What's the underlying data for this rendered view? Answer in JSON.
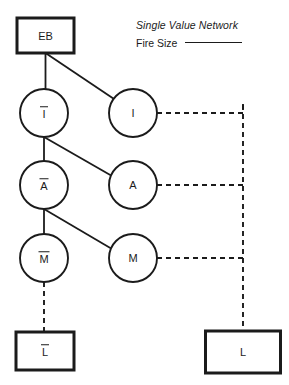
{
  "legend": {
    "title": "Single Value Network",
    "field_label": "Fire Size",
    "field_value": ""
  },
  "diagram": {
    "type": "influence-network",
    "stroke_color": "#1b1b1b",
    "background": "#ffffff",
    "nodes": [
      {
        "id": "EB",
        "label": "EB",
        "overbar": false,
        "shape": "rect",
        "column": "left",
        "cx": 45.5,
        "cy": 35.5,
        "w": 57,
        "h": 35
      },
      {
        "id": "I_bar",
        "label": "I",
        "overbar": true,
        "shape": "circle",
        "column": "left",
        "cx": 44,
        "cy": 113,
        "r": 24
      },
      {
        "id": "I",
        "label": "I",
        "overbar": false,
        "shape": "circle",
        "column": "right",
        "cx": 133,
        "cy": 113,
        "r": 24
      },
      {
        "id": "A_bar",
        "label": "A",
        "overbar": true,
        "shape": "circle",
        "column": "left",
        "cx": 44,
        "cy": 185,
        "r": 24
      },
      {
        "id": "A",
        "label": "A",
        "overbar": false,
        "shape": "circle",
        "column": "right",
        "cx": 133,
        "cy": 185,
        "r": 24
      },
      {
        "id": "M_bar",
        "label": "M",
        "overbar": true,
        "shape": "circle",
        "column": "left",
        "cx": 44,
        "cy": 258,
        "r": 24
      },
      {
        "id": "M",
        "label": "M",
        "overbar": false,
        "shape": "circle",
        "column": "right",
        "cx": 133,
        "cy": 258,
        "r": 24
      },
      {
        "id": "L_bar",
        "label": "L",
        "overbar": true,
        "shape": "rect",
        "column": "left",
        "cx": 45,
        "cy": 351,
        "w": 58,
        "h": 38
      },
      {
        "id": "L",
        "label": "L",
        "overbar": false,
        "shape": "rect",
        "column": "right",
        "cx": 243,
        "cy": 352,
        "w": 75,
        "h": 42
      }
    ],
    "edges": [
      {
        "from": "EB",
        "to": "I_bar",
        "style": "solid"
      },
      {
        "from": "EB",
        "to": "I",
        "style": "solid"
      },
      {
        "from": "I_bar",
        "to": "A_bar",
        "style": "solid"
      },
      {
        "from": "I_bar",
        "to": "A",
        "style": "solid"
      },
      {
        "from": "A_bar",
        "to": "M_bar",
        "style": "solid"
      },
      {
        "from": "A_bar",
        "to": "M",
        "style": "solid"
      },
      {
        "from": "M_bar",
        "to": "L_bar",
        "style": "dashed"
      },
      {
        "from": "I",
        "to": "L",
        "style": "dashed"
      },
      {
        "from": "A",
        "to": "L",
        "style": "dashed"
      },
      {
        "from": "M",
        "to": "L",
        "style": "dashed"
      }
    ],
    "bus_x": 243
  }
}
